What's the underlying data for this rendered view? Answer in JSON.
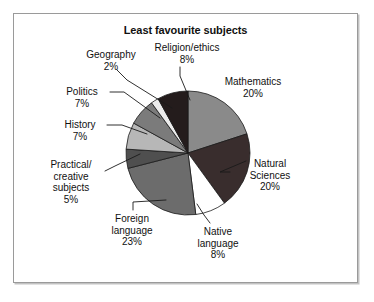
{
  "chart": {
    "title": "Least favourite subjects"
  },
  "chart_data": {
    "type": "pie",
    "title": "Least favourite subjects",
    "xlabel": "",
    "ylabel": "",
    "legend_position": "none",
    "grid": false,
    "unit": "%",
    "start_angle_deg": 0,
    "direction": "clockwise",
    "categories": [
      "Mathematics",
      "Natural Sciences",
      "Native language",
      "Foreign language",
      "Practical/creative subjects",
      "History",
      "Politics",
      "Geography",
      "Religion/ethics"
    ],
    "values": [
      20,
      20,
      8,
      23,
      5,
      7,
      7,
      2,
      8
    ],
    "colors": [
      "#8a8a8a",
      "#392d2d",
      "#ffffff",
      "#6c6c6c",
      "#4f4f4f",
      "#b7b7b7",
      "#7b7b7b",
      "#ececec",
      "#241c1c"
    ],
    "slices": [
      {
        "label": "Mathematics",
        "value": 20,
        "display": "20%",
        "color": "#8a8a8a"
      },
      {
        "label": "Natural Sciences",
        "value": 20,
        "display": "20%",
        "color": "#392d2d"
      },
      {
        "label": "Native language",
        "value": 8,
        "display": "8%",
        "color": "#ffffff"
      },
      {
        "label": "Foreign language",
        "value": 23,
        "display": "23%",
        "color": "#6c6c6c"
      },
      {
        "label": "Practical/creative subjects",
        "value": 5,
        "display": "5%",
        "color": "#4f4f4f"
      },
      {
        "label": "History",
        "value": 7,
        "display": "7%",
        "color": "#b7b7b7"
      },
      {
        "label": "Politics",
        "value": 7,
        "display": "7%",
        "color": "#7b7b7b"
      },
      {
        "label": "Geography",
        "value": 2,
        "display": "2%",
        "color": "#ececec"
      },
      {
        "label": "Religion/ethics",
        "value": 8,
        "display": "8%",
        "color": "#241c1c"
      }
    ]
  },
  "labels": {
    "geography": {
      "name": "Geography",
      "pct": "2%"
    },
    "religion": {
      "name": "Religion/ethics",
      "pct": "8%"
    },
    "mathematics": {
      "name": "Mathematics",
      "pct": "20%"
    },
    "politics": {
      "name": "Politics",
      "pct": "7%"
    },
    "history": {
      "name": "History",
      "pct": "7%"
    },
    "practical": {
      "name_line1": "Practical/",
      "name_line2": "creative",
      "name_line3": "subjects",
      "pct": "5%"
    },
    "natural": {
      "name_line1": "Natural",
      "name_line2": "Sciences",
      "pct": "20%"
    },
    "foreign": {
      "name_line1": "Foreign",
      "name_line2": "language",
      "pct": "23%"
    },
    "native": {
      "name_line1": "Native",
      "name_line2": "language",
      "pct": "8%"
    }
  }
}
